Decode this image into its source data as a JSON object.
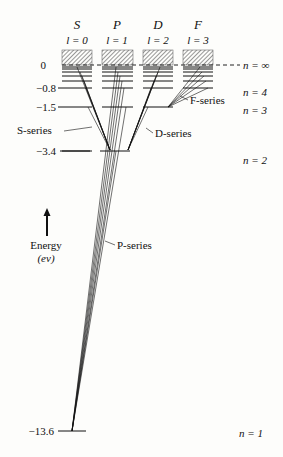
{
  "diagram": {
    "type": "energy-level-diagram",
    "columns": [
      {
        "letter": "S",
        "l_label": "l = 0"
      },
      {
        "letter": "P",
        "l_label": "l = 1"
      },
      {
        "letter": "D",
        "l_label": "l = 2"
      },
      {
        "letter": "F",
        "l_label": "l = 3"
      }
    ],
    "energy_ticks": [
      {
        "value": "0",
        "y": 65
      },
      {
        "value": "−0.8",
        "y": 88
      },
      {
        "value": "−1.5",
        "y": 107
      },
      {
        "value": "−3.4",
        "y": 151
      },
      {
        "value": "−13.6",
        "y": 431
      }
    ],
    "n_labels": [
      {
        "text": "n = ∞",
        "y": 68
      },
      {
        "text": "n = 4",
        "y": 95
      },
      {
        "text": "n = 3",
        "y": 113
      },
      {
        "text": "n = 2",
        "y": 162
      },
      {
        "text": "n = 1",
        "y": 435
      }
    ],
    "series_labels": {
      "s": "S-series",
      "p": "P-series",
      "d": "D-series",
      "f": "F-series"
    },
    "axis": {
      "label": "Energy",
      "unit": "(ev)"
    }
  }
}
